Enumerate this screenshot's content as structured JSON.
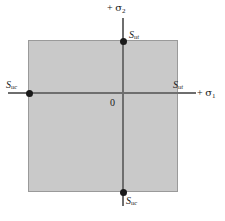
{
  "figure": {
    "type": "stress-plane-diagram"
  },
  "colors": {
    "region_fill": "#c9c9c9",
    "region_border": "#9a9a9a",
    "axis": "#6e6e6e",
    "dot": "#1a1a1a",
    "background": "#ffffff",
    "text": "#1a1a1a"
  },
  "axes": {
    "vertical": {
      "label_plus": "+",
      "label_symbol": "σ",
      "label_subscript": "2",
      "label_full": "+ σ₂"
    },
    "horizontal": {
      "label_plus": "+",
      "label_symbol": "σ",
      "label_subscript": "1",
      "label_full": "+ σ₁"
    },
    "origin_label": "0"
  },
  "points": [
    {
      "id": "sut-top",
      "symbol": "S",
      "subscript": "ut",
      "label_full": "S_ut",
      "position": "top",
      "description": "tensile ultimate strength on sigma-2 axis"
    },
    {
      "id": "suc-left",
      "symbol": "S",
      "subscript": "uc",
      "label_full": "S_uc",
      "position": "left",
      "description": "compressive ultimate strength on negative sigma-1 axis"
    },
    {
      "id": "sut-right",
      "symbol": "S",
      "subscript": "ut",
      "label_full": "S_ut",
      "position": "right",
      "description": "tensile ultimate strength on sigma-1 axis"
    },
    {
      "id": "suc-bottom",
      "symbol": "S",
      "subscript": "uc",
      "label_full": "S_uc",
      "position": "bottom",
      "description": "compressive ultimate strength on negative sigma-2 axis"
    }
  ],
  "region": {
    "name": "safe-region",
    "shape": "square"
  }
}
